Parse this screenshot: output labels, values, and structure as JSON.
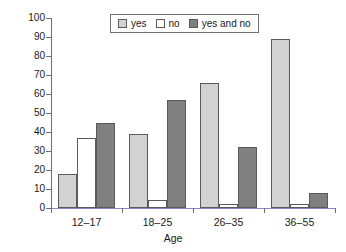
{
  "chart_data": {
    "type": "bar",
    "title": "",
    "xlabel": "Age",
    "ylabel": "Percentage",
    "categories": [
      "12–17",
      "18–25",
      "26–35",
      "36–55"
    ],
    "series": [
      {
        "name": "yes",
        "values": [
          18,
          39,
          66,
          89
        ],
        "color": "#d2d2d2"
      },
      {
        "name": "no",
        "values": [
          37,
          4,
          2,
          2
        ],
        "color": "#ffffff"
      },
      {
        "name": "yes and no",
        "values": [
          45,
          57,
          32,
          8
        ],
        "color": "#808080"
      }
    ],
    "ylim": [
      0,
      100
    ],
    "yticks": [
      0,
      10,
      20,
      30,
      40,
      50,
      60,
      70,
      80,
      90,
      100
    ],
    "ytick_labels": [
      "0",
      "10",
      "20",
      "30",
      "40",
      "50",
      "60",
      "70",
      "80",
      "90",
      "100"
    ],
    "grid": false,
    "legend_position": "top-center"
  },
  "legend": {
    "entries": [
      {
        "label": "yes"
      },
      {
        "label": "no"
      },
      {
        "label": "yes and no"
      }
    ]
  },
  "axes": {
    "y_title": "Percentage",
    "x_title": "Age"
  }
}
